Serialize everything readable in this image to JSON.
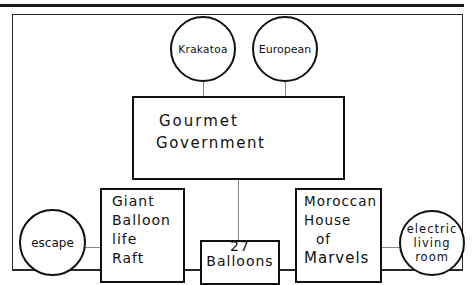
{
  "diagram": {
    "type": "hierarchy",
    "colors": {
      "stroke": "#111111",
      "connector": "#888888",
      "background": "#ffffff"
    },
    "nodes": {
      "krakatoa": {
        "shape": "circle",
        "label": "Krakatoa"
      },
      "european": {
        "shape": "circle",
        "label": "European"
      },
      "gourmet_government": {
        "shape": "box",
        "lines": [
          "Gourmet",
          "Government"
        ]
      },
      "giant_balloon_life_raft": {
        "shape": "box",
        "lines": [
          "Giant",
          "Balloon",
          "life",
          "Raft"
        ]
      },
      "balloons_27": {
        "shape": "box",
        "lines": [
          "27",
          "Balloons"
        ]
      },
      "moroccan_house_of_marvels": {
        "shape": "box",
        "lines": [
          "Moroccan",
          "House",
          "of",
          "Marvels"
        ]
      },
      "escape": {
        "shape": "circle",
        "label": "escape"
      },
      "electric_living_room": {
        "shape": "circle",
        "lines": [
          "electric",
          "living",
          "room"
        ]
      }
    },
    "edges": [
      {
        "from": "krakatoa",
        "to": "gourmet_government"
      },
      {
        "from": "european",
        "to": "gourmet_government"
      },
      {
        "from": "gourmet_government",
        "to": "balloons_27"
      },
      {
        "from": "escape",
        "to": "giant_balloon_life_raft"
      },
      {
        "from": "moroccan_house_of_marvels",
        "to": "electric_living_room"
      }
    ]
  }
}
